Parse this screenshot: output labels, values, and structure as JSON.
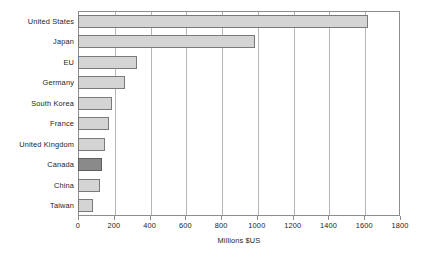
{
  "chart_data": {
    "type": "bar",
    "orientation": "horizontal",
    "title": "",
    "xlabel": "Millions $US",
    "ylabel": "",
    "xlim": [
      0,
      1800
    ],
    "xticks": [
      0,
      200,
      400,
      600,
      800,
      1000,
      1200,
      1400,
      1600,
      1800
    ],
    "grid": "vertical",
    "legend": "none",
    "categories": [
      "United States",
      "Japan",
      "EU",
      "Germany",
      "South Korea",
      "France",
      "United Kingdom",
      "Canada",
      "China",
      "Taiwan"
    ],
    "values": [
      1620,
      990,
      330,
      265,
      190,
      175,
      150,
      135,
      125,
      85
    ],
    "highlight_category": "Canada",
    "colors": {
      "bar_fill": "#d4d4d4",
      "bar_stroke": "#7a7a7a",
      "highlight_fill": "#8a8a8a",
      "highlight_stroke": "#5e5e5e",
      "gridline": "#b5b5b5",
      "frame": "#8d8d8d",
      "text": "#1d1d1d",
      "background": "#ffffff"
    }
  }
}
